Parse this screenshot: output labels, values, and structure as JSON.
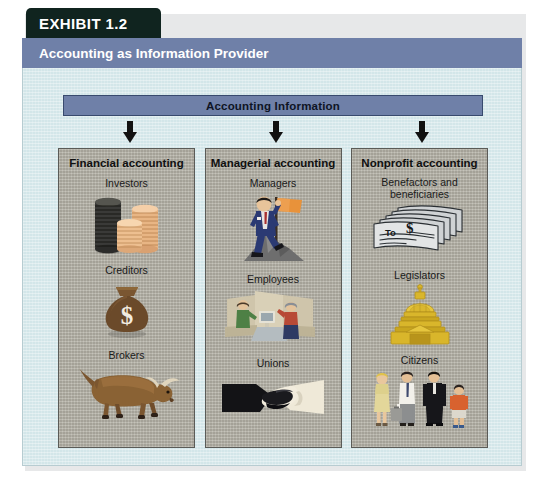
{
  "exhibit": {
    "tag": "EXHIBIT 1.2",
    "title": "Accounting as Information Provider",
    "banner": "Accounting Information"
  },
  "colors": {
    "tag_bg": "#10241f",
    "titlebar_bg": "#6f80a8",
    "body_bg": "#d3e6e9",
    "panel_bg": "#b4b1a6",
    "banner_bg": "#6f80a8",
    "arrow": "#111111",
    "gold": "#d9b62b",
    "money_bag": "#6b4a2a",
    "bull": "#8a6234",
    "suit_navy": "#2b3a73",
    "flag_orange": "#e8923a"
  },
  "columns": [
    {
      "id": "financial",
      "title": "Financial accounting",
      "arrow_name": "arrow-financial",
      "entries": [
        {
          "label": "Investors",
          "icon": "coin-stacks-icon"
        },
        {
          "label": "Creditors",
          "icon": "money-bag-icon"
        },
        {
          "label": "Brokers",
          "icon": "bull-icon"
        }
      ]
    },
    {
      "id": "managerial",
      "title": "Managerial accounting",
      "arrow_name": "arrow-managerial",
      "entries": [
        {
          "label": "Managers",
          "icon": "businessman-flag-icon"
        },
        {
          "label": "Employees",
          "icon": "office-workers-icon"
        },
        {
          "label": "Unions",
          "icon": "handshake-icon"
        }
      ]
    },
    {
      "id": "nonprofit",
      "title": "Nonprofit accounting",
      "arrow_name": "arrow-nonprofit",
      "entries": [
        {
          "label": "Benefactors and beneficiaries",
          "icon": "checks-stack-icon",
          "check_to": "To",
          "check_dollar": "$"
        },
        {
          "label": "Legislators",
          "icon": "capitol-dome-icon"
        },
        {
          "label": "Citizens",
          "icon": "people-group-icon"
        }
      ]
    }
  ]
}
